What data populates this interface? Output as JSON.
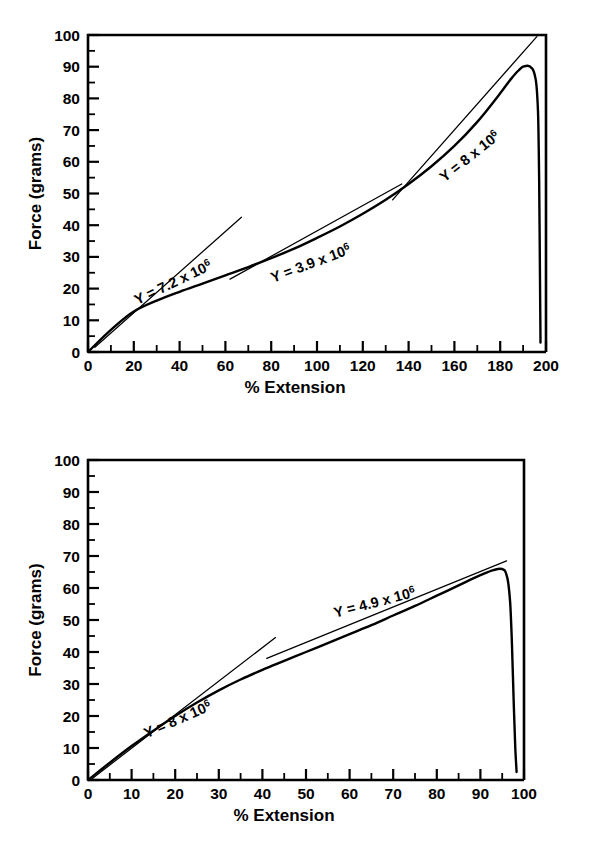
{
  "figure": {
    "charts": [
      {
        "id": "upper",
        "chart_data": {
          "type": "line",
          "title": "",
          "xlabel": "% Extension",
          "ylabel": "Force (grams)",
          "xlim": [
            0,
            200
          ],
          "ylim": [
            0,
            100
          ],
          "x_major_step": 20,
          "x_minor_step": 10,
          "y_major_step": 10,
          "y_minor_step": 5,
          "grid": false,
          "legend": "none",
          "xticks": [
            "0",
            "20",
            "40",
            "60",
            "80",
            "100",
            "120",
            "140",
            "160",
            "180",
            "200"
          ],
          "yticks": [
            "0",
            "10",
            "20",
            "30",
            "40",
            "50",
            "60",
            "70",
            "80",
            "90",
            "100"
          ],
          "series": [
            {
              "name": "force-extension-curve",
              "x": [
                0,
                10,
                20,
                30,
                40,
                50,
                60,
                70,
                80,
                90,
                100,
                110,
                120,
                130,
                140,
                150,
                160,
                170,
                180,
                185,
                188,
                190,
                192,
                194,
                195.5,
                196.5,
                197,
                197.3,
                197.6
              ],
              "y": [
                0,
                7.0,
                12.8,
                16.2,
                19.0,
                21.6,
                24.2,
                26.8,
                29.6,
                32.6,
                36.0,
                39.6,
                43.6,
                48.0,
                53.0,
                58.6,
                65.0,
                72.6,
                81.6,
                86.4,
                88.8,
                90.0,
                90.3,
                89.4,
                86.0,
                76.0,
                55.0,
                30.0,
                3.0
              ]
            }
          ],
          "annotations": [
            {
              "name": "modulus-label-1",
              "text_prefix": "Y = 7.2 x 10",
              "text_sup": "6",
              "x": 38,
              "y": 20.5,
              "rotation": -25.5,
              "tangent": {
                "x1": 3,
                "y1": 1.5,
                "x2": 67,
                "y2": 42.5
              }
            },
            {
              "name": "modulus-label-2",
              "text_prefix": "Y = 3.9 x 10",
              "text_sup": "6",
              "x": 98,
              "y": 26.5,
              "rotation": -20.5,
              "tangent": {
                "x1": 62,
                "y1": 23.0,
                "x2": 137,
                "y2": 53.0
              }
            },
            {
              "name": "modulus-label-3",
              "text_prefix": "Y = 8 x 10",
              "text_sup": "6",
              "x": 168,
              "y": 60.5,
              "rotation": -38.5,
              "tangent": {
                "x1": 133,
                "y1": 48.0,
                "x2": 196,
                "y2": 99.5
              }
            }
          ]
        }
      },
      {
        "id": "lower",
        "chart_data": {
          "type": "line",
          "title": "",
          "xlabel": "% Extension",
          "ylabel": "Force (grams)",
          "xlim": [
            0,
            100
          ],
          "ylim": [
            0,
            100
          ],
          "x_major_step": 10,
          "x_minor_step": 5,
          "y_major_step": 10,
          "y_minor_step": 5,
          "grid": false,
          "legend": "none",
          "xticks": [
            "0",
            "10",
            "20",
            "30",
            "40",
            "50",
            "60",
            "70",
            "80",
            "90",
            "100"
          ],
          "yticks": [
            "0",
            "10",
            "20",
            "30",
            "40",
            "50",
            "60",
            "70",
            "80",
            "90",
            "100"
          ],
          "series": [
            {
              "name": "force-extension-curve",
              "x": [
                0,
                5,
                10,
                15,
                20,
                25,
                30,
                35,
                40,
                45,
                50,
                55,
                60,
                65,
                70,
                75,
                80,
                85,
                90,
                93,
                94.5,
                95.5,
                96.2,
                96.8,
                97.2,
                97.6,
                98.0,
                98.3
              ],
              "y": [
                0,
                5.4,
                10.6,
                15.4,
                20.0,
                24.2,
                28.0,
                31.4,
                34.4,
                37.2,
                40.0,
                42.8,
                45.6,
                48.4,
                51.4,
                54.4,
                57.6,
                60.8,
                64.0,
                65.6,
                66.0,
                65.6,
                63.0,
                56.0,
                44.0,
                26.0,
                10.0,
                2.5
              ]
            }
          ],
          "annotations": [
            {
              "name": "modulus-label-1",
              "text_prefix": "Y = 8 x 10",
              "text_sup": "6",
              "x": 21,
              "y": 17.5,
              "rotation": -23.5,
              "tangent": {
                "x1": 1,
                "y1": 0.5,
                "x2": 43,
                "y2": 44.5
              }
            },
            {
              "name": "modulus-label-2",
              "text_prefix": "Y = 4.9 x 10",
              "text_sup": "6",
              "x": 66,
              "y": 54.0,
              "rotation": -14.5,
              "tangent": {
                "x1": 41,
                "y1": 38.0,
                "x2": 96,
                "y2": 68.5
              }
            }
          ]
        }
      }
    ]
  }
}
